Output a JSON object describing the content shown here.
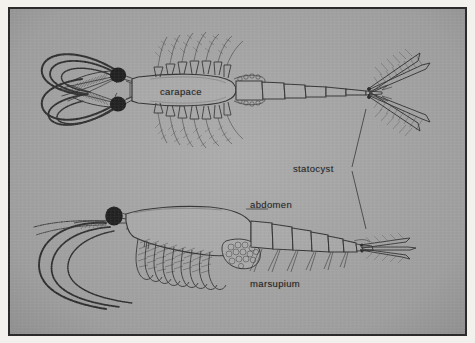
{
  "figure": {
    "caption_type": "scientific-illustration",
    "background_color": "#a2a2a2",
    "ink_color": "#262626",
    "frame_color": "#2b2b2b",
    "page_color": "#f2f1ee",
    "eye_color": "#0d0d0d"
  },
  "labels": {
    "carapace": "carapace",
    "statocyst": "statocyst",
    "abdomen": "abdomen",
    "marsupium": "marsupium"
  },
  "specimens": [
    {
      "id": "dorsal-view",
      "name": "dorsal view",
      "parts": [
        "antennae",
        "eyes",
        "carapace",
        "thoracic legs",
        "abdomen segments",
        "uropods",
        "telson",
        "statocyst"
      ],
      "labels": [
        "carapace"
      ]
    },
    {
      "id": "lateral-view",
      "name": "lateral view",
      "parts": [
        "antennae",
        "eye",
        "carapace",
        "thoracic legs",
        "marsupium",
        "abdomen segments",
        "pleopods",
        "uropods",
        "telson",
        "statocyst"
      ],
      "labels": [
        "abdomen",
        "marsupium"
      ]
    }
  ],
  "leaders": {
    "statocyst_upper_target": "upper specimen tail base",
    "statocyst_lower_target": "lower specimen tail base"
  }
}
